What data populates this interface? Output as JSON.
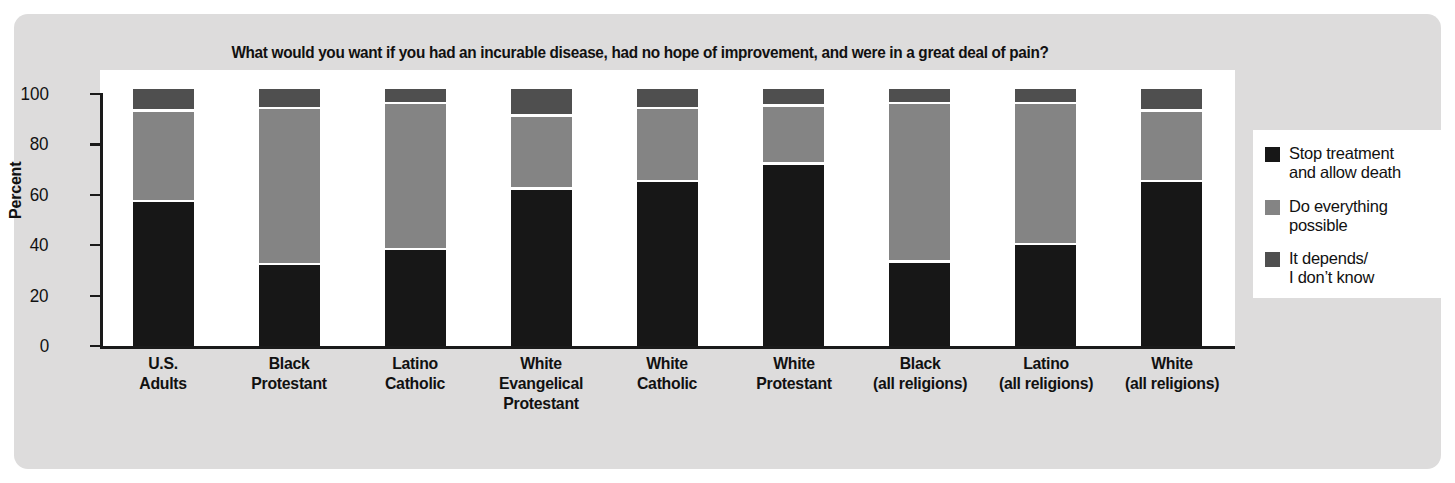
{
  "chart_data": {
    "type": "bar",
    "subtype": "stacked-bar-100",
    "title": "What would you want if you had an incurable disease, had no hope of improvement, and were in a great deal of pain?",
    "xlabel": "",
    "ylabel": "Percent",
    "ylim": [
      0,
      100
    ],
    "yticks": [
      0,
      20,
      40,
      60,
      80,
      100
    ],
    "grid": false,
    "legend_position": "right",
    "categories": [
      "U.S.\nAdults",
      "Black\nProtestant",
      "Latino\nCatholic",
      "White\nEvangelical\nProtestant",
      "White\nCatholic",
      "White\nProtestant",
      "Black\n(all religions)",
      "Latino\n(all religions)",
      "White\n(all religions)"
    ],
    "series": [
      {
        "name": "Stop treatment and allow death",
        "color": "#171717",
        "values": [
          57,
          32,
          38,
          62,
          65,
          72,
          33,
          40,
          65
        ]
      },
      {
        "name": "Do everything possible",
        "color": "#848484",
        "values": [
          35,
          61,
          57,
          28,
          28,
          22,
          62,
          55,
          27
        ]
      },
      {
        "name": "It depends/I don't know",
        "color": "#4f4f4f",
        "values": [
          8,
          7,
          5,
          10,
          7,
          6,
          5,
          5,
          8
        ]
      }
    ]
  },
  "axis": {
    "y_title": "Percent",
    "y_tick_labels": [
      "100",
      "80",
      "60",
      "40",
      "20",
      "0"
    ]
  },
  "x_labels": [
    [
      "U.S.",
      "Adults"
    ],
    [
      "Black",
      "Protestant"
    ],
    [
      "Latino",
      "Catholic"
    ],
    [
      "White",
      "Evangelical",
      "Protestant"
    ],
    [
      "White",
      "Catholic"
    ],
    [
      "White",
      "Protestant"
    ],
    [
      "Black",
      "(all religions)"
    ],
    [
      "Latino",
      "(all religions)"
    ],
    [
      "White",
      "(all religions)"
    ]
  ],
  "legend": {
    "items": [
      {
        "color": "#171717",
        "lines": [
          "Stop treatment",
          "and allow death"
        ]
      },
      {
        "color": "#848484",
        "lines": [
          "Do everything",
          "possible"
        ]
      },
      {
        "color": "#4f4f4f",
        "lines": [
          "It depends/",
          "I don’t know"
        ]
      }
    ]
  },
  "colors": {
    "panel_background": "#dddcdc",
    "plot_background": "#ffffff",
    "axis": "#1a1a1a",
    "text": "#111111"
  }
}
